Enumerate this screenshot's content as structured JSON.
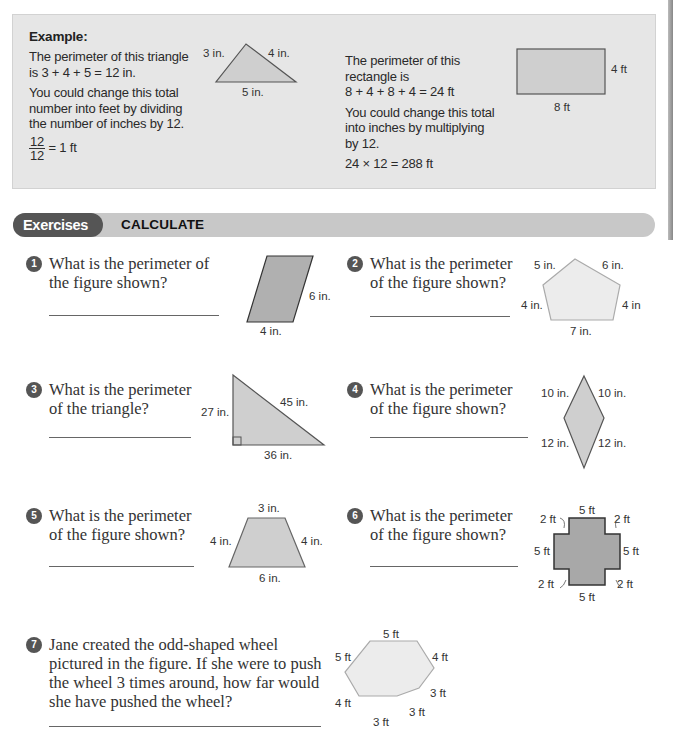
{
  "example": {
    "title": "Example:",
    "left": {
      "line1": "The perimeter of this triangle",
      "line2": "is 3 + 4 + 5 = 12 in.",
      "line3": "You could change this total",
      "line4": "number into feet by dividing",
      "line5": "the number of inches by 12.",
      "frac_num": "12",
      "frac_den": "12",
      "frac_result": "= 1 ft"
    },
    "triangle_labels": {
      "left": "3 in.",
      "right": "4 in.",
      "bottom": "5 in."
    },
    "right": {
      "line1": "The perimeter of this",
      "line2": "rectangle is",
      "line3": "8 + 4 + 8 + 4 = 24 ft",
      "line4": "You could change this total",
      "line5": "into inches by multiplying",
      "line6": "by 12.",
      "line7": "24 × 12 = 288 ft"
    },
    "rectangle_labels": {
      "right": "4 ft",
      "bottom": "8 ft"
    }
  },
  "banner": {
    "pill": "Exercises",
    "heading": "CALCULATE"
  },
  "questions": [
    {
      "num": "1",
      "line1": "What is the perimeter of",
      "line2": "the figure shown?",
      "labels": {
        "side": "6 in.",
        "bottom": "4 in."
      }
    },
    {
      "num": "2",
      "line1": "What is the perimeter",
      "line2": "of the figure shown?",
      "labels": {
        "top_left": "5 in.",
        "top_right": "6 in.",
        "left": "4 in.",
        "right": "4 in",
        "bottom": "7 in."
      }
    },
    {
      "num": "3",
      "line1": "What is the perimeter",
      "line2": "of the triangle?",
      "labels": {
        "left": "27 in.",
        "hyp": "45 in.",
        "bottom": "36 in."
      }
    },
    {
      "num": "4",
      "line1": "What is the perimeter",
      "line2": "of the figure shown?",
      "labels": {
        "top_left": "10 in.",
        "top_right": "10 in.",
        "bottom_left": "12 in.",
        "bottom_right": "12 in."
      }
    },
    {
      "num": "5",
      "line1": "What is the perimeter",
      "line2": "of the figure shown?",
      "labels": {
        "top": "3 in.",
        "left": "4 in.",
        "right": "4 in.",
        "bottom": "6 in."
      }
    },
    {
      "num": "6",
      "line1": "What is the perimeter",
      "line2": "of the figure shown?",
      "labels": {
        "top": "5 ft",
        "bottom": "5 ft",
        "left": "5 ft",
        "right": "5 ft",
        "tl": "2 ft",
        "tr": "2 ft",
        "bl": "2 ft",
        "br": "2 ft"
      }
    },
    {
      "num": "7",
      "line1": "Jane created the odd-shaped wheel",
      "line2": "pictured in the figure. If she were to push",
      "line3": "the wheel 3 times around, how far would",
      "line4": "she have pushed the wheel?",
      "labels": {
        "top": "5 ft",
        "top_left": "5 ft",
        "top_right": "4 ft",
        "right": "3 ft",
        "bottom_right": "3 ft",
        "bottom": "3 ft",
        "left": "4 ft"
      }
    }
  ]
}
